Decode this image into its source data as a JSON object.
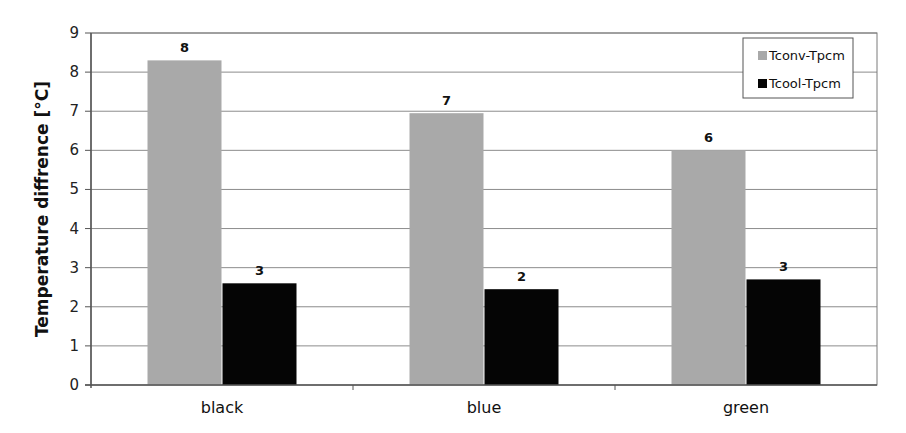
{
  "chart_data": {
    "type": "bar",
    "title": "",
    "xlabel": "",
    "ylabel": "Temperature diffrence [°C]",
    "ylim": [
      0,
      9
    ],
    "yticks": [
      0,
      1,
      2,
      3,
      4,
      5,
      6,
      7,
      8,
      9
    ],
    "grid": true,
    "legend_position": "top-right (inside plot)",
    "categories": [
      "black",
      "blue",
      "green"
    ],
    "series": [
      {
        "name": "Tconv-Tpcm",
        "color": "#a9a9a9",
        "values": [
          8.3,
          6.95,
          6.0
        ],
        "data_labels": [
          "8",
          "7",
          "6"
        ]
      },
      {
        "name": "Tcool-Tpcm",
        "color": "#050505",
        "values": [
          2.6,
          2.45,
          2.7
        ],
        "data_labels": [
          "3",
          "2",
          "3"
        ]
      }
    ]
  },
  "colors": {
    "gridline": "#8c8c8c",
    "axis": "#555555",
    "frame": "#7a7a7a"
  }
}
